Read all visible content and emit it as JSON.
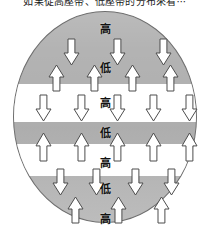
{
  "caption": {
    "text": "如果從高壓帶、低壓帶的分布來看⋯"
  },
  "colors": {
    "globe_fill": "#b3b3b3",
    "globe_stroke": "#6e6e6e",
    "band_fill": "#ffffff",
    "arrow_fill": "#ffffff",
    "arrow_stroke": "#4d4d4d",
    "label_text": "#111111",
    "page_background": "#ffffff"
  },
  "diagram": {
    "name": "global-pressure-belt-circulation",
    "shape": "circle",
    "labels": {
      "high": "高",
      "low": "低"
    },
    "pressure_labels": [
      {
        "id": "label-high-polar-north",
        "text": "高",
        "x": 92,
        "y": 18,
        "meaning": "high"
      },
      {
        "id": "label-low-subpolar-north",
        "text": "低",
        "x": 92,
        "y": 57,
        "meaning": "low"
      },
      {
        "id": "label-high-subtropical-north",
        "text": "高",
        "x": 92,
        "y": 92,
        "meaning": "high"
      },
      {
        "id": "label-low-equatorial",
        "text": "低",
        "x": 92,
        "y": 122,
        "meaning": "low"
      },
      {
        "id": "label-high-subtropical-south",
        "text": "高",
        "x": 92,
        "y": 152,
        "meaning": "high"
      },
      {
        "id": "label-low-subpolar-south",
        "text": "低",
        "x": 92,
        "y": 178,
        "meaning": "low"
      },
      {
        "id": "label-high-polar-south",
        "text": "高",
        "x": 92,
        "y": 208,
        "meaning": "high"
      }
    ],
    "arrow_rows": [
      {
        "id": "row-north-polar-descend",
        "direction": "down",
        "count": 3,
        "xs": [
          58,
          104,
          150
        ],
        "y": 28,
        "height": 26,
        "width": 15
      },
      {
        "id": "row-north-subpolar-ascend",
        "direction": "up",
        "count": 4,
        "xs": [
          43,
          81,
          119,
          157
        ],
        "y": 54,
        "height": 26,
        "width": 15
      },
      {
        "id": "row-north-subtropical-descend",
        "direction": "down",
        "count": 5,
        "xs": [
          30,
          68,
          104,
          140,
          176
        ],
        "y": 84,
        "height": 26,
        "width": 15
      },
      {
        "id": "row-equatorial-ascend",
        "direction": "up",
        "count": 5,
        "xs": [
          30,
          68,
          104,
          140,
          176
        ],
        "y": 122,
        "height": 28,
        "width": 15
      },
      {
        "id": "row-south-subtropical-descend",
        "direction": "down",
        "count": 4,
        "xs": [
          47,
          83,
          122,
          158
        ],
        "y": 158,
        "height": 26,
        "width": 15
      },
      {
        "id": "row-south-subpolar-ascend",
        "direction": "up",
        "count": 3,
        "xs": [
          62,
          105,
          148
        ],
        "y": 186,
        "height": 26,
        "width": 15
      }
    ],
    "bands": [
      {
        "id": "band-north",
        "top": 72,
        "height": 38
      },
      {
        "id": "band-south",
        "top": 132,
        "height": 32
      }
    ]
  }
}
